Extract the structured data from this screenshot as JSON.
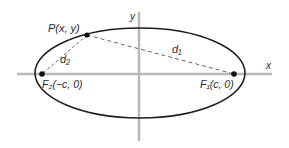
{
  "diagram": {
    "type": "ellipse-foci",
    "colors": {
      "axis": "#b8b8b8",
      "curve": "#1e1e1e",
      "dashed": "#555555",
      "text": "#2a2a2a",
      "point": "#111111"
    },
    "axes": {
      "x_label": "x",
      "y_label": "y"
    },
    "point_p": {
      "label": "P(x, y)"
    },
    "focus_1": {
      "label": "F₁(c, 0)"
    },
    "focus_2": {
      "label": "F₂(−c, 0)"
    },
    "distances": {
      "d1": "d₁",
      "d2": "d₂"
    }
  }
}
